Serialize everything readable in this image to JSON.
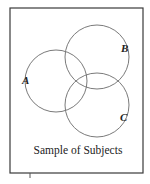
{
  "diagram": {
    "type": "venn",
    "title": "Sample of Subjects",
    "frame": {
      "x": 10,
      "y": 8,
      "width": 133,
      "height": 165,
      "stroke": "#3a3a3a"
    },
    "tick_mark": {
      "x": 30,
      "y1": 173,
      "y2": 178
    },
    "sets": [
      {
        "label": "A",
        "cx": 56,
        "cy": 81,
        "r": 31,
        "label_x": 22,
        "label_y": 84
      },
      {
        "label": "B",
        "cx": 97,
        "cy": 57,
        "r": 32,
        "label_x": 121,
        "label_y": 52
      },
      {
        "label": "C",
        "cx": 97,
        "cy": 105,
        "r": 32,
        "label_x": 120,
        "label_y": 121
      }
    ],
    "circle_stroke": "#7a7a7a",
    "caption": {
      "text": "Sample of Subjects",
      "x": 78,
      "y": 154
    }
  }
}
